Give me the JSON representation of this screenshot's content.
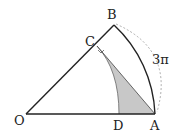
{
  "diagram": {
    "points": {
      "O": {
        "label": "O"
      },
      "A": {
        "label": "A"
      },
      "B": {
        "label": "B"
      },
      "C": {
        "label": "C"
      },
      "D": {
        "label": "D"
      }
    },
    "arc_length_label": "3π",
    "colors": {
      "stroke": "#222222",
      "shade": "#c8c8c8",
      "dashed": "#999999"
    }
  }
}
